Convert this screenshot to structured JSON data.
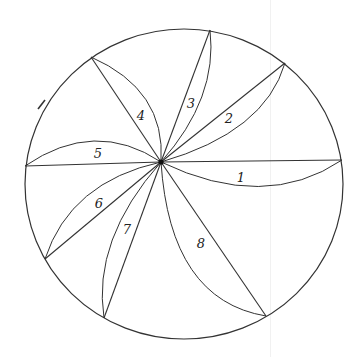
{
  "diagram": {
    "type": "hand-drawn circle divided into numbered curved sectors",
    "stroke_color": "#333333",
    "background": "#ffffff",
    "circle": {
      "cx": 184,
      "cy": 184,
      "rx": 159,
      "ry": 155
    },
    "hub": {
      "x": 161,
      "y": 162
    },
    "sectors": [
      {
        "number": "1",
        "end": [
          342,
          160
        ],
        "ctrl": [
          265,
          212
        ],
        "label_pos": [
          241,
          177
        ]
      },
      {
        "number": "2",
        "end": [
          285,
          63
        ],
        "ctrl": [
          265,
          132
        ],
        "label_pos": [
          229,
          118
        ]
      },
      {
        "number": "3",
        "end": [
          210,
          30
        ],
        "ctrl": [
          218,
          98
        ],
        "label_pos": [
          191,
          103
        ]
      },
      {
        "number": "4",
        "end": [
          91,
          57
        ],
        "ctrl": [
          166,
          90
        ],
        "label_pos": [
          141,
          115
        ]
      },
      {
        "number": "5",
        "end": [
          25,
          166
        ],
        "ctrl": [
          95,
          118
        ],
        "label_pos": [
          98,
          153
        ]
      },
      {
        "number": "6",
        "end": [
          45,
          259
        ],
        "ctrl": [
          70,
          182
        ],
        "label_pos": [
          99,
          203
        ]
      },
      {
        "number": "7",
        "end": [
          104,
          318
        ],
        "ctrl": [
          92,
          240
        ],
        "label_pos": [
          127,
          229
        ]
      },
      {
        "number": "8",
        "end": [
          266,
          316
        ],
        "ctrl": [
          170,
          300
        ],
        "label_pos": [
          201,
          243
        ]
      }
    ],
    "stray_mark": {
      "x1": 38,
      "y1": 109,
      "x2": 45,
      "y2": 100
    }
  }
}
